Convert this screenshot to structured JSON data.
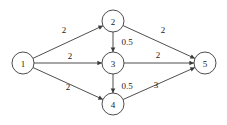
{
  "diagram": {
    "type": "directed-weighted-graph",
    "title": "",
    "background_color": "#ffffff",
    "stroke_color": "#3a3a3a",
    "text_color": "#1a1a1a",
    "node_radius": 11,
    "nodes": [
      {
        "id": "1",
        "label": "1",
        "x": 23,
        "y": 63
      },
      {
        "id": "2",
        "label": "2",
        "x": 113,
        "y": 21
      },
      {
        "id": "3",
        "label": "3",
        "x": 113,
        "y": 63
      },
      {
        "id": "4",
        "label": "4",
        "x": 113,
        "y": 104
      },
      {
        "id": "5",
        "label": "5",
        "x": 205,
        "y": 63
      }
    ],
    "edges": [
      {
        "from": "1",
        "to": "2",
        "weight": "2",
        "label_x": 64,
        "label_y": 30,
        "directed": true
      },
      {
        "from": "1",
        "to": "3",
        "weight": "2",
        "label_x": 70,
        "label_y": 56,
        "directed": true
      },
      {
        "from": "1",
        "to": "4",
        "weight": "2",
        "label_x": 68,
        "label_y": 87,
        "directed": true
      },
      {
        "from": "2",
        "to": "3",
        "weight": "0.5",
        "label_x": 127,
        "label_y": 42,
        "directed": true
      },
      {
        "from": "2",
        "to": "5",
        "weight": "2",
        "label_x": 163,
        "label_y": 30,
        "directed": true
      },
      {
        "from": "3",
        "to": "4",
        "weight": "0.5",
        "label_x": 127,
        "label_y": 86,
        "directed": true
      },
      {
        "from": "3",
        "to": "5",
        "weight": "2",
        "label_x": 158,
        "label_y": 55,
        "directed": true
      },
      {
        "from": "4",
        "to": "5",
        "weight": "3",
        "label_x": 156,
        "label_y": 85,
        "directed": true
      }
    ]
  }
}
